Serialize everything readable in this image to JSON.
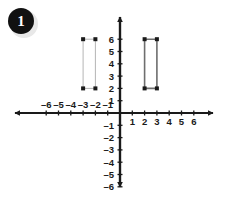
{
  "badge": {
    "number": "1",
    "bg_color": "#111111",
    "text_color": "#ffffff"
  },
  "chart_data": {
    "type": "scatter",
    "title": "",
    "xlabel": "",
    "ylabel": "",
    "xlim": [
      -7,
      7
    ],
    "ylim": [
      -7,
      7
    ],
    "grid": false,
    "legend": "none",
    "axis_color": "#1a1a1a",
    "x_ticks": [
      -6,
      -5,
      -4,
      -3,
      -2,
      -1,
      1,
      2,
      3,
      4,
      5,
      6
    ],
    "y_ticks": [
      6,
      5,
      4,
      3,
      2,
      1,
      -1,
      -2,
      -3,
      -4,
      -5,
      -6
    ],
    "x_tick_labels_negative": [
      "–6",
      "–5",
      "–4",
      "–3",
      "–2",
      "–1"
    ],
    "x_tick_labels_positive": [
      "1",
      "2",
      "3",
      "4",
      "5",
      "6"
    ],
    "y_tick_labels_positive": [
      "6",
      "5",
      "4",
      "3",
      "2",
      "1"
    ],
    "y_tick_labels_negative": [
      "–1",
      "–2",
      "–3",
      "–4",
      "–5",
      "–6"
    ],
    "series": [
      {
        "name": "left-rectangle",
        "shape": "rectangle",
        "edge_color": "#b5b5b5",
        "vertex_color": "#1a1a1a",
        "edge_width": 1,
        "points": [
          {
            "x": -3,
            "y": 6
          },
          {
            "x": -2,
            "y": 6
          },
          {
            "x": -2,
            "y": 2
          },
          {
            "x": -3,
            "y": 2
          }
        ],
        "width_units": 1,
        "height_units": 4
      },
      {
        "name": "right-rectangle",
        "shape": "rectangle",
        "edge_color": "#6e6e6e",
        "vertex_color": "#1a1a1a",
        "edge_width": 1.6,
        "points": [
          {
            "x": 2,
            "y": 6
          },
          {
            "x": 3,
            "y": 6
          },
          {
            "x": 3,
            "y": 2
          },
          {
            "x": 2,
            "y": 2
          }
        ],
        "width_units": 1,
        "height_units": 4
      }
    ]
  },
  "geometry": {
    "origin_x": 120,
    "origin_y": 113,
    "unit_px": 12.3,
    "x_axis_left_end": 8,
    "x_axis_right_end": 220,
    "y_axis_top_end": 10,
    "y_axis_bottom_end": 194
  }
}
